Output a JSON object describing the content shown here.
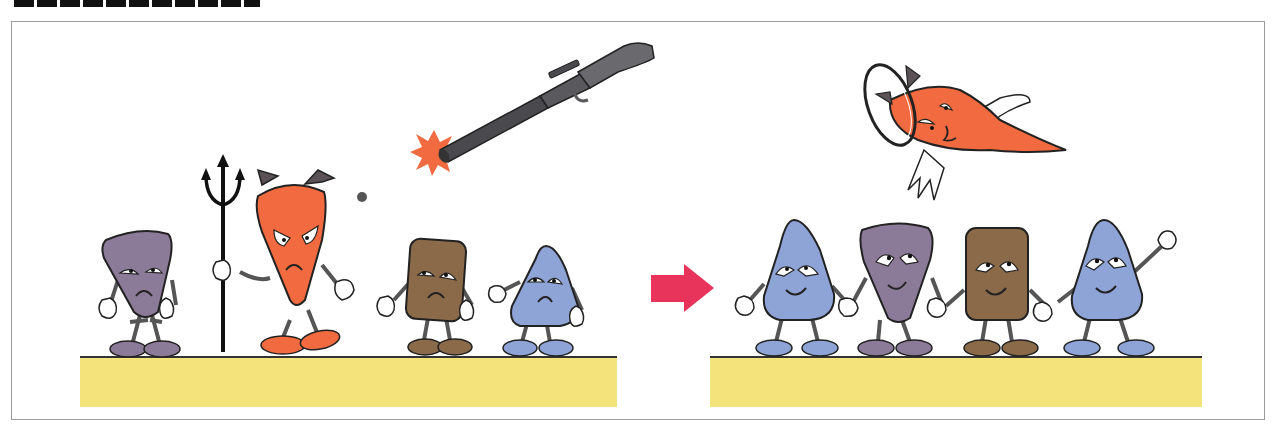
{
  "header": {
    "title": "",
    "clipped": true
  },
  "colors": {
    "ground": "#f3e37a",
    "ground_edge": "#333333",
    "devil": "#f26a3f",
    "horn": "#5b5258",
    "purple": "#8b7a98",
    "brown": "#8a6a48",
    "blue": "#8ea3d6",
    "arrow": "#e8335a",
    "rifle": "#5a5a5e",
    "flash": "#f26a3f",
    "outline": "#222222"
  },
  "scene": {
    "before": {
      "characters": [
        "purple-sad",
        "devil-angry-with-trident",
        "brown-sad",
        "blue-sad"
      ],
      "props": [
        "trident",
        "rifle",
        "muzzle-flash",
        "bullet"
      ]
    },
    "transition": "arrow-right",
    "after": {
      "characters": [
        "blue-happy",
        "purple-happy",
        "brown-happy",
        "blue-happy-waving"
      ],
      "props": [
        "angel-devil-with-halo-and-wings"
      ]
    }
  }
}
